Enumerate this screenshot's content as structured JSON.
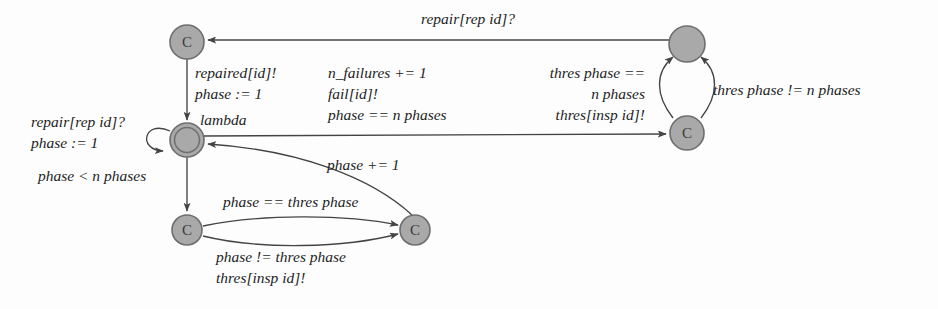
{
  "diagram": {
    "background_color": "#fdfdfd",
    "node_fill_color": "#a9a9a9",
    "node_stroke_color": "#6e6e6e",
    "edge_color": "#444444"
  },
  "nodes": [
    {
      "id": "repairing",
      "label": "C",
      "cx": 187,
      "cy": 42,
      "r": 17,
      "initial": false
    },
    {
      "id": "lambda",
      "label": "",
      "cx": 187,
      "cy": 140,
      "r": 17,
      "initial": true
    },
    {
      "id": "inspect_left",
      "label": "C",
      "cx": 187,
      "cy": 230,
      "r": 15,
      "initial": false
    },
    {
      "id": "inspect_right",
      "label": "C",
      "cx": 415,
      "cy": 230,
      "r": 15,
      "initial": false
    },
    {
      "id": "failed",
      "label": "",
      "cx": 687,
      "cy": 44,
      "r": 18,
      "initial": false
    },
    {
      "id": "failed_commit",
      "label": "C",
      "cx": 687,
      "cy": 133,
      "r": 17,
      "initial": false
    }
  ],
  "labels": {
    "repair_top": "repair[rep id]?",
    "repaired_block": [
      "repaired[id]!",
      "phase := 1"
    ],
    "failure_block": [
      "n_failures += 1",
      "fail[id]!",
      "phase == n phases"
    ],
    "thres_eq_block": [
      "thres phase ==",
      "n phases",
      "thres[insp id]!"
    ],
    "thres_neq": "thres phase != n phases",
    "lambda_name": "lambda",
    "repair_loop_block": [
      "repair[rep id]?",
      "phase := 1"
    ],
    "phase_lt": "phase < n phases",
    "phase_inc": "phase += 1",
    "phase_eq_thres": "phase == thres phase",
    "phase_neq_block": [
      "phase != thres phase",
      "thres[insp id]!"
    ]
  }
}
